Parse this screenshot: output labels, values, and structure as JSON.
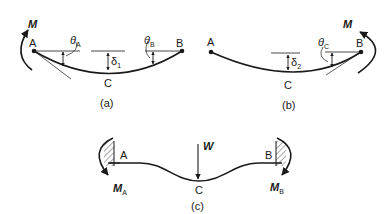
{
  "figure": {
    "panels": [
      {
        "id": "a",
        "caption": "(a)",
        "points": {
          "left": "A",
          "right": "B",
          "mid": "C"
        },
        "moment_label": "M",
        "angle_left": {
          "symbol": "θ",
          "sub": "A"
        },
        "angle_right": {
          "symbol": "θ",
          "sub": "B"
        },
        "deflection": {
          "symbol": "δ",
          "sub": "1"
        }
      },
      {
        "id": "b",
        "caption": "(b)",
        "points": {
          "left": "A",
          "right": "B",
          "mid": "C"
        },
        "moment_label": "M",
        "angle_right": {
          "symbol": "θ",
          "sub": "C"
        },
        "deflection": {
          "symbol": "δ",
          "sub": "2"
        }
      },
      {
        "id": "c",
        "caption": "(c)",
        "points": {
          "left": "A",
          "right": "B",
          "mid": "C"
        },
        "load_label": "W",
        "moment_left": {
          "symbol": "M",
          "sub": "A"
        },
        "moment_right": {
          "symbol": "M",
          "sub": "B"
        }
      }
    ]
  }
}
